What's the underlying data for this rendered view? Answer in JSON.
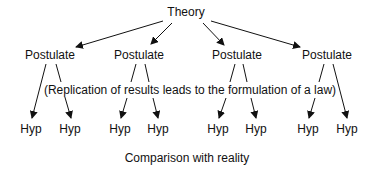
{
  "diagram": {
    "root": {
      "label": "Theory",
      "x": 186,
      "y": 11
    },
    "postulates": [
      {
        "label": "Postulate",
        "x": 50,
        "y": 48
      },
      {
        "label": "Postulate",
        "x": 139,
        "y": 48
      },
      {
        "label": "Postulate",
        "x": 237,
        "y": 48
      },
      {
        "label": "Postulate",
        "x": 327,
        "y": 48
      }
    ],
    "note": {
      "label": "(Replication of results leads to the formulation of a law)",
      "x": 189,
      "y": 88
    },
    "hypotheses": [
      {
        "label": "Hyp",
        "x": 31,
        "y": 125
      },
      {
        "label": "Hyp",
        "x": 69,
        "y": 125
      },
      {
        "label": "Hyp",
        "x": 120,
        "y": 125
      },
      {
        "label": "Hyp",
        "x": 158,
        "y": 125
      },
      {
        "label": "Hyp",
        "x": 217,
        "y": 125
      },
      {
        "label": "Hyp",
        "x": 255,
        "y": 125
      },
      {
        "label": "Hyp",
        "x": 307,
        "y": 125
      },
      {
        "label": "Hyp",
        "x": 346,
        "y": 125
      }
    ],
    "footer": {
      "label": "Comparison with reality",
      "x": 186,
      "y": 158
    },
    "line_color": "#111111"
  }
}
